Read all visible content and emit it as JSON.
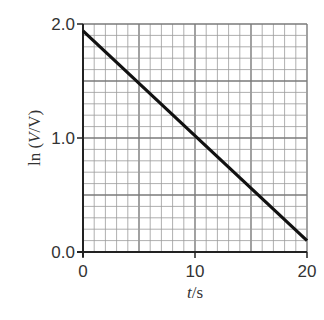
{
  "chart_data": {
    "type": "line",
    "title": "",
    "xlabel": "t/s",
    "ylabel": "ln (V/V)",
    "xlim": [
      0,
      20
    ],
    "ylim": [
      0.0,
      2.0
    ],
    "x_ticks": [
      "0",
      "10",
      "20"
    ],
    "y_ticks": [
      "0.0",
      "1.0",
      "2.0"
    ],
    "grid": true,
    "grid_minor_x_step": 1,
    "grid_minor_y_step": 0.1,
    "legend": null,
    "series": [
      {
        "name": "ln(V/V) vs t",
        "x": [
          0,
          20
        ],
        "y": [
          1.94,
          0.1
        ],
        "color": "#111111"
      }
    ]
  },
  "labels": {
    "xlabel_italic": "t",
    "xlabel_rest": "/s",
    "ylabel_prefix": "ln (",
    "ylabel_italic": "V",
    "ylabel_rest": "/V)"
  }
}
